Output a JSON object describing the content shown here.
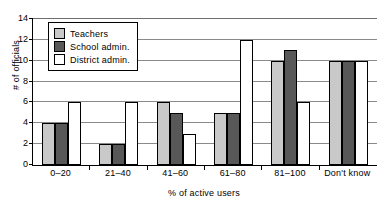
{
  "chart_data": {
    "type": "bar",
    "title": "",
    "xlabel": "% of active users",
    "ylabel": "# of officials",
    "categories": [
      "0–20",
      "21–40",
      "41–60",
      "61–80",
      "81–100",
      "Don't know"
    ],
    "series": [
      {
        "name": "Teachers",
        "color": "#c9c9c9",
        "values": [
          4,
          2,
          6,
          5,
          10,
          10
        ]
      },
      {
        "name": "School admin.",
        "color": "#585858",
        "values": [
          4,
          2,
          5,
          5,
          11,
          10
        ]
      },
      {
        "name": "District admin.",
        "color": "#ffffff",
        "values": [
          6,
          6,
          3,
          12,
          6,
          10
        ]
      }
    ],
    "ylim": [
      0,
      14
    ],
    "yticks": [
      0,
      2,
      4,
      6,
      8,
      10,
      12,
      14
    ],
    "ytick_labels": [
      "0",
      "2",
      "4",
      "6",
      "8",
      "10",
      "12",
      "14"
    ],
    "grid": true,
    "grid_axis": "y",
    "legend_position": "upper-left-inside"
  }
}
